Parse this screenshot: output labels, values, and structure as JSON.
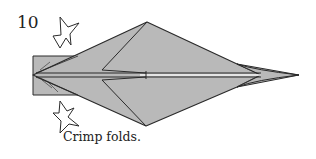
{
  "step": {
    "number": "10"
  },
  "caption": {
    "text": "Crimp folds."
  },
  "colors": {
    "paper_fill": "#b9b9b9",
    "outline": "#2a2a2a",
    "background": "#ffffff"
  },
  "diagram": {
    "arrows": [
      {
        "name": "crimp-arrow-top",
        "direction": "down",
        "style": "hollow push arrow"
      },
      {
        "name": "crimp-arrow-bottom",
        "direction": "up",
        "style": "hollow push arrow"
      }
    ]
  }
}
